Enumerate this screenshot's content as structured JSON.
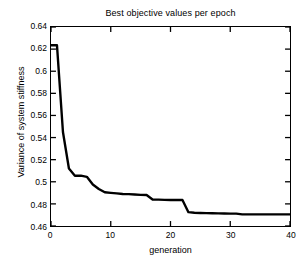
{
  "chart_data": {
    "type": "line",
    "title": "Best objective values per epoch",
    "xlabel": "generation",
    "ylabel": "Variance of system stiffness",
    "xlim": [
      0,
      40
    ],
    "ylim": [
      0.46,
      0.64
    ],
    "xticks": [
      0,
      10,
      20,
      30,
      40
    ],
    "xtick_labels": [
      "0",
      "10",
      "20",
      "30",
      "40"
    ],
    "yticks": [
      0.46,
      0.48,
      0.5,
      0.52,
      0.54,
      0.56,
      0.58,
      0.6,
      0.62,
      0.64
    ],
    "ytick_labels": [
      "0.46",
      "0.48",
      "0.5",
      "0.52",
      "0.54",
      "0.56",
      "0.58",
      "0.6",
      "0.62",
      "0.64"
    ],
    "grid": false,
    "legend": null,
    "series": [
      {
        "name": "best objective value",
        "color": "#000000",
        "x": [
          0,
          1,
          2,
          3,
          4,
          5,
          6,
          7,
          8,
          9,
          10,
          11,
          12,
          13,
          14,
          15,
          16,
          17,
          18,
          19,
          20,
          21,
          22,
          23,
          24,
          25,
          26,
          27,
          28,
          29,
          30,
          31,
          32,
          33,
          34,
          35,
          36,
          37,
          38,
          39,
          40
        ],
        "y": [
          0.6235,
          0.6235,
          0.545,
          0.512,
          0.5055,
          0.5055,
          0.5045,
          0.4975,
          0.4935,
          0.4905,
          0.49,
          0.4895,
          0.489,
          0.4888,
          0.4885,
          0.4882,
          0.488,
          0.484,
          0.4838,
          0.4836,
          0.4835,
          0.4835,
          0.4835,
          0.4725,
          0.472,
          0.4718,
          0.4716,
          0.4715,
          0.4714,
          0.4713,
          0.4712,
          0.4712,
          0.4705,
          0.4705,
          0.4705,
          0.4705,
          0.4705,
          0.4705,
          0.4705,
          0.4705,
          0.4705
        ]
      }
    ]
  }
}
